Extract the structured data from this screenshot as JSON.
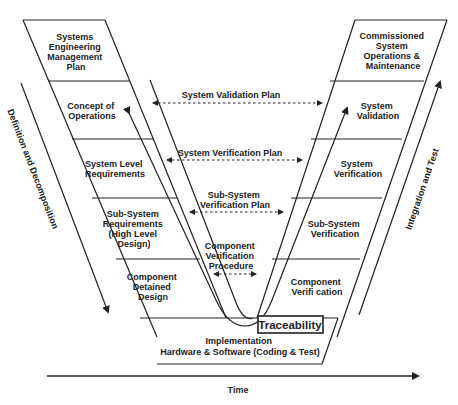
{
  "left_column": [
    {
      "lines": [
        "Systems",
        "Engineering",
        "Management",
        "Plan"
      ]
    },
    {
      "lines": [
        "Concept of",
        "Operations"
      ]
    },
    {
      "lines": [
        "System Level",
        "Requirements"
      ]
    },
    {
      "lines": [
        "Sub-System",
        "Requirements",
        "(High Level",
        "Design)"
      ]
    },
    {
      "lines": [
        "Component",
        "Detained",
        "Design"
      ]
    }
  ],
  "right_column": [
    {
      "lines": [
        "Commissioned",
        "System",
        "Operations &",
        "Maintenance"
      ]
    },
    {
      "lines": [
        "System",
        "Validation"
      ]
    },
    {
      "lines": [
        "System",
        "Verification"
      ]
    },
    {
      "lines": [
        "Sub-System",
        "Verification"
      ]
    },
    {
      "lines": [
        "Component",
        "Verifi cation"
      ]
    }
  ],
  "bottom": {
    "lines": [
      "Implementation",
      "Hardware & Software (Coding & Test)"
    ]
  },
  "plans": [
    {
      "lines": [
        "System Validation Plan"
      ]
    },
    {
      "lines": [
        "System Verification Plan"
      ]
    },
    {
      "lines": [
        "Sub-System",
        "Verification Plan"
      ]
    },
    {
      "lines": [
        "Component",
        "Verification",
        "Procedure"
      ]
    }
  ],
  "traceability_label": "Traceability",
  "left_axis_label": "Definition and Decomposition",
  "right_axis_label": "Integration and Test",
  "time_axis_label": "Time"
}
